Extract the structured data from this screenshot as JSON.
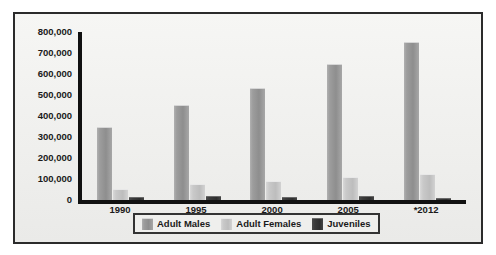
{
  "chart_data": {
    "type": "bar",
    "title": "",
    "xlabel": "",
    "ylabel": "",
    "categories": [
      "1990",
      "1995",
      "2000",
      "2005",
      "*2012"
    ],
    "series": [
      {
        "name": "Adult Males",
        "color": "#9a9a9a",
        "values": [
          345000,
          450000,
          530000,
          645000,
          750000
        ]
      },
      {
        "name": "Adult Females",
        "color": "#c8c8c8",
        "values": [
          50000,
          70000,
          85000,
          105000,
          120000
        ]
      },
      {
        "name": "Juveniles",
        "color": "#333333",
        "values": [
          8000,
          14000,
          8000,
          12000,
          6000
        ]
      }
    ],
    "ylim": [
      0,
      800000
    ],
    "yticks": [
      "800,000",
      "700,000",
      "600,000",
      "500,000",
      "400,000",
      "300,000",
      "200,000",
      "100,000",
      "0"
    ],
    "ytick_values": [
      800000,
      700000,
      600000,
      500000,
      400000,
      300000,
      200000,
      100000,
      0
    ],
    "grid": false,
    "legend_position": "bottom-center"
  },
  "legend": {
    "items": [
      {
        "label": "Adult Males"
      },
      {
        "label": "Adult Females"
      },
      {
        "label": "Juveniles"
      }
    ]
  }
}
